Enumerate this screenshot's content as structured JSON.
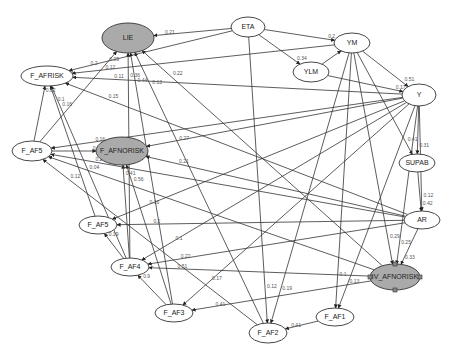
{
  "diagram": {
    "type": "path-diagram",
    "colors": {
      "edge": "#333333",
      "node_fill_default": "#ffffff",
      "node_fill_highlight": "#aaaaaa",
      "edge_label": "#555555"
    },
    "nodes": [
      {
        "id": "LIE",
        "label": "LIE",
        "cx": 128,
        "cy": 38,
        "rx": 26,
        "ry": 15,
        "highlight": true
      },
      {
        "id": "ETA",
        "label": "ETA",
        "cx": 248,
        "cy": 27,
        "rx": 17,
        "ry": 10,
        "highlight": false
      },
      {
        "id": "YM",
        "label": "YM",
        "cx": 352,
        "cy": 43,
        "rx": 18,
        "ry": 10,
        "highlight": false
      },
      {
        "id": "YLM",
        "label": "YLM",
        "cx": 311,
        "cy": 72,
        "rx": 18,
        "ry": 10,
        "highlight": false
      },
      {
        "id": "Y",
        "label": "Y",
        "cx": 419,
        "cy": 95,
        "rx": 17,
        "ry": 11,
        "highlight": false
      },
      {
        "id": "F_AFRISK",
        "label": "F_AFRISK",
        "cx": 47,
        "cy": 76,
        "rx": 26,
        "ry": 10,
        "highlight": false
      },
      {
        "id": "F_AF5",
        "label": "F_AF5",
        "cx": 32,
        "cy": 151,
        "rx": 20,
        "ry": 10,
        "highlight": false
      },
      {
        "id": "F_AFNORISK",
        "label": "F_AFNORISK",
        "cx": 122,
        "cy": 151,
        "rx": 26,
        "ry": 14,
        "highlight": true
      },
      {
        "id": "SUPAB",
        "label": "SUPAB",
        "cx": 417,
        "cy": 163,
        "rx": 18,
        "ry": 9,
        "highlight": false
      },
      {
        "id": "AR",
        "label": "AR",
        "cx": 422,
        "cy": 220,
        "rx": 18,
        "ry": 9,
        "highlight": false
      },
      {
        "id": "F_AF5b",
        "label": "F_AF5",
        "cx": 98,
        "cy": 225,
        "rx": 19,
        "ry": 9,
        "highlight": false
      },
      {
        "id": "F_AF4",
        "label": "F_AF4",
        "cx": 130,
        "cy": 267,
        "rx": 19,
        "ry": 9,
        "highlight": false
      },
      {
        "id": "IV_AFNORISK",
        "label": "IV_AFNORISK",
        "cx": 395,
        "cy": 277,
        "rx": 25,
        "ry": 13,
        "highlight": true
      },
      {
        "id": "F_AF1",
        "label": "F_AF1",
        "cx": 335,
        "cy": 317,
        "rx": 19,
        "ry": 9,
        "highlight": false
      },
      {
        "id": "F_AF3",
        "label": "F_AF3",
        "cx": 174,
        "cy": 313,
        "rx": 19,
        "ry": 9,
        "highlight": false
      },
      {
        "id": "F_AF2",
        "label": "F_AF2",
        "cx": 268,
        "cy": 333,
        "rx": 19,
        "ry": 10,
        "highlight": false
      }
    ],
    "edges": [
      {
        "from": "ETA",
        "to": "LIE",
        "label": "0.21"
      },
      {
        "from": "ETA",
        "to": "YM",
        "label": "0.2"
      },
      {
        "from": "ETA",
        "to": "YLM",
        "label": "0.34"
      },
      {
        "from": "YLM",
        "to": "YM",
        "label": "0.25"
      },
      {
        "from": "YM",
        "to": "Y",
        "label": "0.51"
      },
      {
        "from": "YLM",
        "to": "Y",
        "label": "0.17"
      },
      {
        "from": "Y",
        "to": "SUPAB",
        "label": "0.31"
      },
      {
        "from": "YM",
        "to": "SUPAB",
        "label": "0.41"
      },
      {
        "from": "SUPAB",
        "to": "AR",
        "label": "0.42"
      },
      {
        "from": "Y",
        "to": "AR",
        "label": "0.12"
      },
      {
        "from": "AR",
        "to": "IV_AFNORISK",
        "label": "0.33"
      },
      {
        "from": "Y",
        "to": "IV_AFNORISK",
        "label": "0.25"
      },
      {
        "from": "YM",
        "to": "IV_AFNORISK",
        "label": "0.29"
      },
      {
        "from": "F_AF5",
        "to": "F_AFRISK",
        "label": "0.62"
      },
      {
        "from": "F_AF4",
        "to": "F_AFRISK",
        "label": "0.16"
      },
      {
        "from": "F_AF5b",
        "to": "F_AFRISK",
        "label": "0.1"
      },
      {
        "from": "Y",
        "to": "F_AFRISK",
        "label": "0.11"
      },
      {
        "from": "YM",
        "to": "F_AFRISK",
        "label": "0.12"
      },
      {
        "from": "ETA",
        "to": "F_AFRISK",
        "label": "0.2"
      },
      {
        "from": "AR",
        "to": "F_AFRISK",
        "label": "0.15"
      },
      {
        "from": "F_AF5",
        "to": "LIE",
        "label": "0.09"
      },
      {
        "from": "F_AF3",
        "to": "LIE",
        "label": "0.44"
      },
      {
        "from": "F_AF4",
        "to": "LIE",
        "label": "0.36"
      },
      {
        "from": "F_AF2",
        "to": "LIE",
        "label": "0.13"
      },
      {
        "from": "IV_AFNORISK",
        "to": "LIE",
        "label": "0.22"
      },
      {
        "from": "F_AF5",
        "to": "F_AFNORISK",
        "label": "0.48"
      },
      {
        "from": "Y",
        "to": "F_AFNORISK",
        "label": "0.27"
      },
      {
        "from": "AR",
        "to": "F_AFNORISK",
        "label": "0.21"
      },
      {
        "from": "F_AF4",
        "to": "F_AFNORISK",
        "label": "0.41"
      },
      {
        "from": "F_AF3",
        "to": "F_AFNORISK",
        "label": "0.56"
      },
      {
        "from": "Y",
        "to": "F_AF5",
        "label": "0.16"
      },
      {
        "from": "AR",
        "to": "F_AF5",
        "label": "0.2"
      },
      {
        "from": "IV_AFNORISK",
        "to": "F_AF5",
        "label": "0.04"
      },
      {
        "from": "F_AF2",
        "to": "F_AF5",
        "label": "0.12"
      },
      {
        "from": "Y",
        "to": "F_AF5b",
        "label": "0.16"
      },
      {
        "from": "AR",
        "to": "F_AF5b",
        "label": "0.2"
      },
      {
        "from": "F_AF4",
        "to": "F_AF5b",
        "label": "0.19"
      },
      {
        "from": "Y",
        "to": "F_AF4",
        "label": "0.1"
      },
      {
        "from": "AR",
        "to": "F_AF4",
        "label": "0.22"
      },
      {
        "from": "IV_AFNORISK",
        "to": "F_AF4",
        "label": "0.51"
      },
      {
        "from": "F_AF3",
        "to": "F_AF4",
        "label": "0.9"
      },
      {
        "from": "Y",
        "to": "F_AF3",
        "label": "0.17"
      },
      {
        "from": "IV_AFNORISK",
        "to": "F_AF3",
        "label": "0.41"
      },
      {
        "from": "ETA",
        "to": "F_AF2",
        "label": "0.12"
      },
      {
        "from": "YM",
        "to": "F_AF2",
        "label": "0.19"
      },
      {
        "from": "F_AF1",
        "to": "F_AF2",
        "label": "0.41"
      },
      {
        "from": "YM",
        "to": "F_AF1",
        "label": "0.1"
      },
      {
        "from": "Y",
        "to": "F_AF1",
        "label": "0.13"
      }
    ],
    "selected_node": "IV_AFNORISK"
  }
}
